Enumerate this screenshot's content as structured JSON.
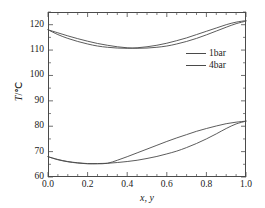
{
  "chart_data": {
    "type": "line",
    "title": "",
    "subtitle": "",
    "xlabel": "x, y",
    "ylabel": "T/°C",
    "xlim": [
      0.0,
      1.0
    ],
    "ylim": [
      60,
      125
    ],
    "grid": false,
    "legend_position": "upper-right-inside",
    "x_ticks": [
      "0.0",
      "0.2",
      "0.4",
      "0.6",
      "0.8",
      "1.0"
    ],
    "x_tick_values": [
      0.0,
      0.2,
      0.4,
      0.6,
      0.8,
      1.0
    ],
    "x_minor_tick_step": 0.05,
    "y_ticks": [
      "60",
      "70",
      "80",
      "90",
      "100",
      "110",
      "120"
    ],
    "y_tick_values": [
      60,
      70,
      80,
      90,
      100,
      110,
      120
    ],
    "y_minor_tick_step": 5,
    "legend": [
      "1bar",
      "4bar"
    ],
    "line_color": "#4a4a4a",
    "series": [
      {
        "name": "4bar bubble",
        "pressure": "4bar",
        "branch": "bubble",
        "x": [
          0.0,
          0.05,
          0.1,
          0.15,
          0.2,
          0.25,
          0.3,
          0.35,
          0.4,
          0.45,
          0.5,
          0.55,
          0.6,
          0.65,
          0.7,
          0.75,
          0.8,
          0.85,
          0.9,
          0.95,
          1.0
        ],
        "values": [
          118.0,
          116.1,
          114.6,
          113.4,
          112.4,
          111.6,
          111.1,
          110.8,
          110.7,
          110.9,
          111.3,
          111.9,
          112.7,
          113.7,
          114.8,
          116.1,
          117.4,
          118.7,
          120.0,
          121.0,
          121.6
        ]
      },
      {
        "name": "4bar dew",
        "pressure": "4bar",
        "branch": "dew",
        "x": [
          0.0,
          0.05,
          0.1,
          0.15,
          0.2,
          0.25,
          0.3,
          0.35,
          0.4,
          0.45,
          0.5,
          0.55,
          0.6,
          0.65,
          0.7,
          0.75,
          0.8,
          0.85,
          0.9,
          0.95,
          1.0
        ],
        "values": [
          118.0,
          116.8,
          115.6,
          114.5,
          113.5,
          112.6,
          111.9,
          111.3,
          110.9,
          110.7,
          110.8,
          111.1,
          111.6,
          112.4,
          113.4,
          114.6,
          116.0,
          117.5,
          119.0,
          120.4,
          121.4
        ]
      },
      {
        "name": "1bar bubble",
        "pressure": "1bar",
        "branch": "bubble",
        "x": [
          0.0,
          0.05,
          0.1,
          0.15,
          0.2,
          0.25,
          0.3,
          0.35,
          0.4,
          0.45,
          0.5,
          0.55,
          0.6,
          0.65,
          0.7,
          0.75,
          0.8,
          0.85,
          0.9,
          0.95,
          1.0
        ],
        "values": [
          68.0,
          66.8,
          66.0,
          65.5,
          65.2,
          65.2,
          65.4,
          66.6,
          68.0,
          69.5,
          71.0,
          72.5,
          74.0,
          75.4,
          76.7,
          78.0,
          79.1,
          80.1,
          81.0,
          81.6,
          82.0
        ]
      },
      {
        "name": "1bar dew",
        "pressure": "1bar",
        "branch": "dew",
        "x": [
          0.0,
          0.05,
          0.1,
          0.15,
          0.2,
          0.25,
          0.3,
          0.35,
          0.4,
          0.45,
          0.5,
          0.55,
          0.6,
          0.65,
          0.7,
          0.75,
          0.8,
          0.85,
          0.9,
          0.95,
          1.0
        ],
        "values": [
          68.0,
          66.9,
          66.1,
          65.6,
          65.3,
          65.3,
          65.4,
          65.7,
          66.1,
          66.6,
          67.3,
          68.1,
          69.1,
          70.2,
          71.6,
          73.2,
          75.0,
          77.0,
          79.1,
          80.9,
          82.0
        ]
      }
    ]
  },
  "legend": {
    "items": [
      {
        "label": "1bar"
      },
      {
        "label": "4bar"
      }
    ]
  },
  "axes": {
    "y_title_symbol": "T",
    "y_title_unit": "/℃",
    "x_title": "x, y"
  }
}
